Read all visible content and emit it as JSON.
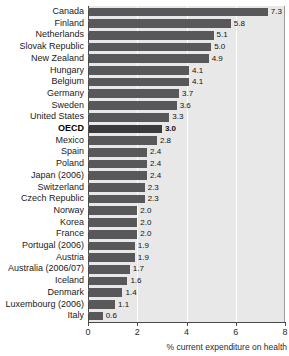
{
  "chart_data": {
    "type": "bar",
    "orientation": "horizontal",
    "title": "",
    "xlabel": "% current expenditure on health",
    "ylabel": "",
    "xlim": [
      0,
      8
    ],
    "xticks": [
      "0",
      "2",
      "4",
      "6",
      "8"
    ],
    "grid": true,
    "legend": false,
    "highlight_category": "OECD",
    "categories": [
      "Canada",
      "Finland",
      "Netherlands",
      "Slovak Republic",
      "New Zealand",
      "Hungary",
      "Belgium",
      "Germany",
      "Sweden",
      "United States",
      "OECD",
      "Mexico",
      "Spain",
      "Poland",
      "Japan (2006)",
      "Switzerland",
      "Czech Republic",
      "Norway",
      "Korea",
      "France",
      "Portugal (2006)",
      "Austria",
      "Australia (2006/07)",
      "Iceland",
      "Denmark",
      "Luxembourg (2006)",
      "Italy"
    ],
    "values": [
      7.3,
      5.8,
      5.1,
      5.0,
      4.9,
      4.1,
      4.1,
      3.7,
      3.6,
      3.3,
      3.0,
      2.8,
      2.4,
      2.4,
      2.4,
      2.3,
      2.3,
      2.0,
      2.0,
      2.0,
      1.9,
      1.9,
      1.7,
      1.6,
      1.4,
      1.1,
      0.6
    ],
    "value_labels": [
      "7.3",
      "5.8",
      "5.1",
      "5.0",
      "4.9",
      "4.1",
      "4.1",
      "3.7",
      "3.6",
      "3.3",
      "3.0",
      "2.8",
      "2.4",
      "2.4",
      "2.4",
      "2.3",
      "2.3",
      "2.0",
      "2.0",
      "2.0",
      "1.9",
      "1.9",
      "1.7",
      "1.6",
      "1.4",
      "1.1",
      "0.6"
    ],
    "colors": {
      "bar": "#58585a",
      "bar_highlight": "#3a3a3c",
      "plot_background": "#e8e8e8",
      "gridline": "#ffffff",
      "axis": "#4a4a4a",
      "text": "#1a1a1a"
    }
  }
}
